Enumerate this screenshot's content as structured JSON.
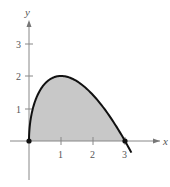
{
  "chart_data": {
    "type": "area",
    "title": "",
    "xlabel": "x",
    "ylabel": "y",
    "function": "y = sqrt(x) * (3 - x)",
    "xlim": [
      -0.3,
      4.2
    ],
    "ylim": [
      -1.3,
      4.2
    ],
    "x_ticks": [
      "1",
      "2",
      "3"
    ],
    "y_ticks": [
      "1",
      "2",
      "3"
    ],
    "grid": false,
    "legend": null,
    "shaded_region": {
      "from_x": 0,
      "to_x": 3,
      "color": "#c8c8c8"
    },
    "points": [
      {
        "x": 0,
        "y": 0
      },
      {
        "x": 0.25,
        "y": 1.375
      },
      {
        "x": 0.5,
        "y": 1.768
      },
      {
        "x": 1,
        "y": 2
      },
      {
        "x": 1.5,
        "y": 1.837
      },
      {
        "x": 2,
        "y": 1.414
      },
      {
        "x": 2.5,
        "y": 0.791
      },
      {
        "x": 3,
        "y": 0
      },
      {
        "x": 3.2,
        "y": -0.358
      }
    ],
    "marked_points": [
      {
        "x": 0,
        "y": 0
      },
      {
        "x": 3,
        "y": 0
      }
    ],
    "colors": {
      "curve": "#111111",
      "fill": "#c8c8c8",
      "axis": "#777777"
    }
  },
  "labels": {
    "x_axis": "x",
    "y_axis": "y",
    "xt1": "1",
    "xt2": "2",
    "xt3": "3",
    "yt1": "1",
    "yt2": "2",
    "yt3": "3"
  }
}
